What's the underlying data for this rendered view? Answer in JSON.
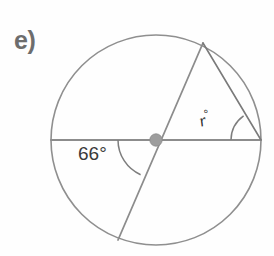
{
  "figure": {
    "part_label": "e)",
    "background_color": "#fefefe",
    "stroke_color": "#8a8a8a",
    "chord_stroke_color": "#6f6f6f",
    "arc_marker_color": "#7a7a7a",
    "center_dot_color": "#9a9a9a",
    "text_color": "#3a3a3a",
    "label_color": "#6d6d6d"
  },
  "circle": {
    "center_x": 156,
    "center_y": 140,
    "radius": 105,
    "center_dot_radius": 6
  },
  "labels": {
    "angle_66": "66°",
    "angle_r_variable": "r",
    "angle_r_degree_symbol": "°"
  },
  "geometry": {
    "horizontal_diameter": {
      "x1": 51,
      "y1": 140,
      "x2": 261,
      "y2": 140
    },
    "slanted_diameter": {
      "x1": 203,
      "y1": 43,
      "x2": 118,
      "y2": 240
    },
    "chord": {
      "x1": 203,
      "y1": 43,
      "x2": 261,
      "y2": 140
    },
    "angle_66_arc": {
      "center_x": 156,
      "center_y": 140,
      "radius": 38,
      "start_angle_deg": 180,
      "end_angle_deg": 246
    },
    "angle_r_arc": {
      "vertex_x": 261,
      "vertex_y": 140,
      "radius": 30
    }
  }
}
